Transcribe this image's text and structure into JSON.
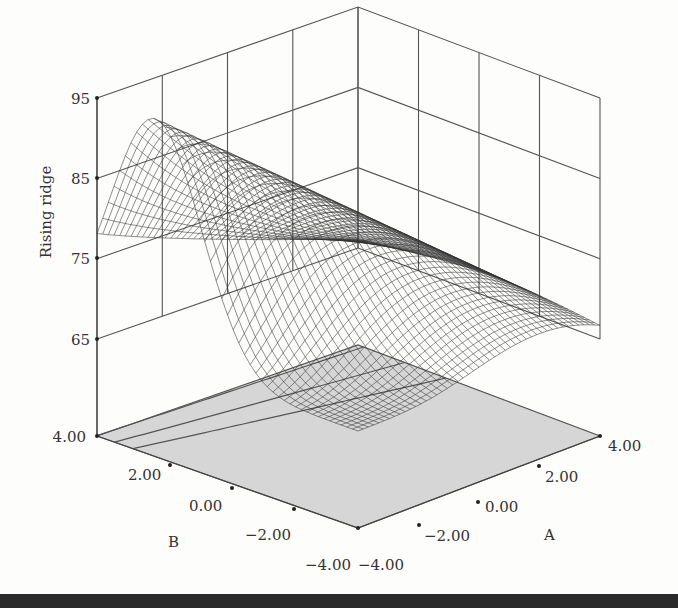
{
  "chart_data": {
    "type": "surface3d",
    "title": "",
    "zlabel": "Rising ridge",
    "xlabel": "A",
    "ylabel": "B",
    "z_ticks": [
      "65",
      "75",
      "85",
      "95"
    ],
    "x_ticks": [
      "-4.00",
      "-2.00",
      "0.00",
      "2.00",
      "4.00"
    ],
    "y_ticks": [
      "-4.00",
      "-2.00",
      "0.00",
      "2.00",
      "4.00"
    ],
    "zlim": [
      65,
      95
    ],
    "xlim": [
      -4,
      4
    ],
    "ylim": [
      -4,
      4
    ],
    "surface_style": "wireframe mesh",
    "floor_contours": true,
    "grid": true
  },
  "labels": {
    "z_axis": "Rising ridge",
    "x_axis": "A",
    "y_axis": "B",
    "z95": "95",
    "z85": "85",
    "z75": "75",
    "z65": "65",
    "b4": "4.00",
    "b2": "2.00",
    "b0": "0.00",
    "bm2": "−2.00",
    "bm4": "−4.00",
    "a4": "4.00",
    "a2": "2.00",
    "a0": "0.00",
    "am2": "−2.00",
    "am4": "−4.00"
  },
  "colors": {
    "grid": "#555555",
    "mesh": "#3a3a3a",
    "floor": "#d6d6d6",
    "contour": "#555555",
    "background": "#fdfdfc"
  }
}
